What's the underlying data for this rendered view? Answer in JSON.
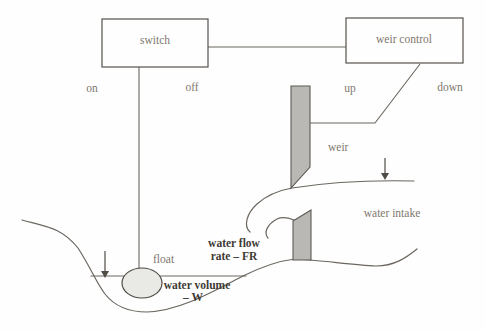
{
  "diagram": {
    "boxes": {
      "switch": "switch",
      "weir_control": "weir control"
    },
    "switch_states": {
      "on": "on",
      "off": "off"
    },
    "weir_states": {
      "up": "up",
      "down": "down"
    },
    "labels": {
      "weir": "weir",
      "water_intake": "water intake",
      "float": "float",
      "water_flow_line1": "water flow",
      "water_flow_line2": "rate – FR",
      "water_volume_line1": "water volume",
      "water_volume_line2": "– W"
    },
    "colors": {
      "background": "#fefefe",
      "line": "#6b665f",
      "box_border": "#55514b",
      "label_text": "#7e786d",
      "bold_label_text": "#3f3b35",
      "weir_gate_fill": "#b9b8b5",
      "float_fill": "#e9e9e5"
    }
  }
}
